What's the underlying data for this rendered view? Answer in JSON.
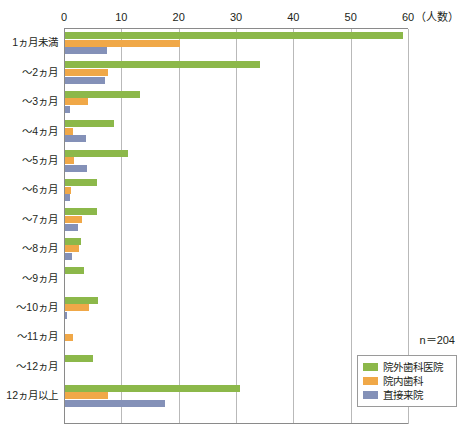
{
  "chart_data": {
    "type": "bar",
    "orientation": "horizontal",
    "title": "",
    "xlabel": "（人数）",
    "ylabel": "",
    "xlim": [
      0,
      60
    ],
    "xticks": [
      0,
      10,
      20,
      30,
      40,
      50,
      60
    ],
    "xtick_labels": [
      "0",
      "10",
      "20",
      "30",
      "40",
      "50",
      "60"
    ],
    "grid": true,
    "legend_position": "bottom-right",
    "annotation": "n＝204",
    "categories": [
      "1ヵ月未満",
      "～2ヵ月",
      "～3ヵ月",
      "～4ヵ月",
      "～5ヵ月",
      "～6ヵ月",
      "～7ヵ月",
      "～8ヵ月",
      "～9ヵ月",
      "～10ヵ月",
      "～11ヵ月",
      "～12ヵ月",
      "12ヵ月以上"
    ],
    "series": [
      {
        "name": "院外歯科医院",
        "color": "#8cb84a",
        "values": [
          59,
          34,
          13,
          8.5,
          11,
          5.5,
          5.5,
          2.8,
          3.3,
          5.7,
          0,
          4.8,
          30.5
        ]
      },
      {
        "name": "院内歯科",
        "color": "#f0a848",
        "values": [
          20,
          7.5,
          4,
          1.4,
          1.6,
          1,
          3,
          2.4,
          0,
          4.2,
          1.4,
          0,
          7.5
        ]
      },
      {
        "name": "直接来院",
        "color": "#8491b8",
        "values": [
          7.3,
          7,
          0.8,
          3.7,
          3.8,
          0.8,
          2.3,
          1.3,
          0,
          0.4,
          0,
          0,
          17.5
        ]
      }
    ]
  },
  "legend": {
    "items": [
      {
        "label": "院外歯科医院",
        "color": "#8cb84a"
      },
      {
        "label": "院内歯科",
        "color": "#f0a848"
      },
      {
        "label": "直接来院",
        "color": "#8491b8"
      }
    ]
  }
}
